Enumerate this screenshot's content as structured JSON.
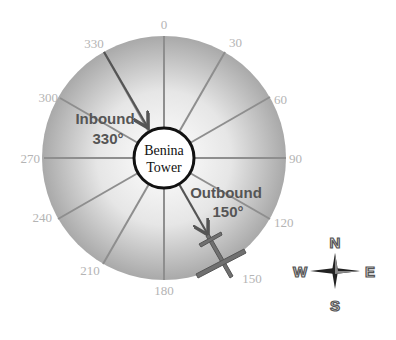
{
  "diagram": {
    "center_label_line1": "Benina",
    "center_label_line2": "Tower",
    "radials": [
      "0",
      "30",
      "60",
      "90",
      "120",
      "150",
      "180",
      "210",
      "240",
      "270",
      "300",
      "330"
    ],
    "inbound": {
      "line1": "Inbound",
      "line2": "330°",
      "heading": 330
    },
    "outbound": {
      "line1": "Outbound",
      "line2": "150°",
      "heading": 150
    },
    "compass": {
      "n": "N",
      "e": "E",
      "s": "S",
      "w": "W"
    },
    "colors": {
      "disc_edge": "#a8a8a8",
      "disc_center": "#ffffff",
      "radial_line": "#8c8c8c",
      "arrow": "#555555",
      "tick_text": "#b4b4b4"
    }
  }
}
